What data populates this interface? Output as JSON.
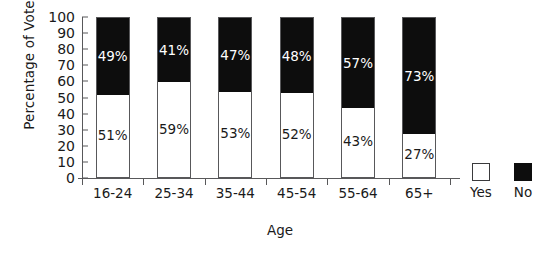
{
  "chart_data": {
    "type": "bar",
    "subtype": "stacked-bar-100-percent",
    "title": "",
    "xlabel": "Age",
    "ylabel": "Percentage of Vote",
    "categories": [
      "16-24",
      "25-34",
      "35-44",
      "45-54",
      "55-64",
      "65+"
    ],
    "series": [
      {
        "name": "Yes",
        "color": "#ffffff",
        "values": [
          51,
          59,
          53,
          52,
          43,
          27
        ],
        "data_labels": [
          "51%",
          "59%",
          "53%",
          "52%",
          "43%",
          "27%"
        ]
      },
      {
        "name": "No",
        "color": "#0d0d0d",
        "values": [
          49,
          41,
          47,
          48,
          57,
          73
        ],
        "data_labels": [
          "49%",
          "41%",
          "47%",
          "48%",
          "57%",
          "73%"
        ]
      }
    ],
    "ylim": [
      0,
      100
    ],
    "yticks": [
      0,
      10,
      20,
      30,
      40,
      50,
      60,
      70,
      80,
      90,
      100
    ],
    "ytick_labels": [
      "0",
      "10",
      "20",
      "30",
      "40",
      "50",
      "60",
      "70",
      "80",
      "90",
      "100"
    ],
    "grid": false,
    "legend": {
      "position": "right-bottom-outside",
      "entries": [
        {
          "label": "Yes",
          "swatch": "white-square-outlined"
        },
        {
          "label": "No",
          "swatch": "black-square-filled"
        }
      ]
    },
    "axis_color": "#58585a",
    "text_color": "#1a1a1a",
    "background": "#ffffff"
  }
}
